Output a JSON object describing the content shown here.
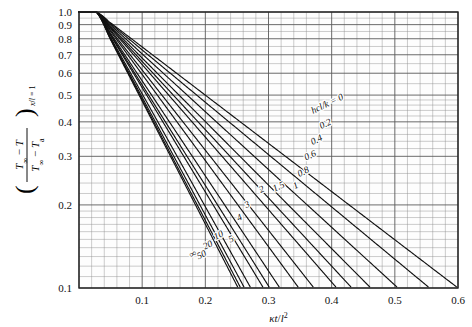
{
  "chart_data": {
    "type": "line",
    "title": "",
    "xlabel": "κt/l²",
    "ylabel": "(T∞ − T)/(T∞ − Ta) at x/l = 1",
    "ylabel_parts": {
      "numerator": "T∞ − T",
      "denominator": "T∞ − Ta",
      "subscript": "x/l = 1"
    },
    "xlim": [
      0,
      0.6
    ],
    "ylim": [
      0.1,
      1.0
    ],
    "yscale": "log",
    "xscale": "linear",
    "grid": true,
    "legend_position": "inline-curve-labels",
    "xticks": [
      0,
      0.1,
      0.2,
      0.3,
      0.4,
      0.5,
      0.6
    ],
    "xticklabels": [
      "",
      "0.1",
      "0.2",
      "0.3",
      "0.4",
      "0.5",
      "0.6"
    ],
    "yticks": [
      0.1,
      0.2,
      0.3,
      0.4,
      0.5,
      0.6,
      0.7,
      0.8,
      0.9,
      1.0
    ],
    "yticklabels": [
      "0.1",
      "0.2",
      "0.3",
      "0.4",
      "0.5",
      "0.6",
      "0.7",
      "0.8",
      "0.9",
      "1.0"
    ],
    "x_minor_step": 0.02,
    "parameter_name": "hcl/k",
    "series": [
      {
        "name": "0",
        "label": "hcl/k = 0",
        "label_x": 0.395,
        "label_y": 0.455
      },
      {
        "name": "0.2",
        "label": "0.2",
        "label_x": 0.392,
        "label_y": 0.385
      },
      {
        "name": "0.4",
        "label": "0.4",
        "label_x": 0.378,
        "label_y": 0.337
      },
      {
        "name": "0.6",
        "label": "0.6",
        "label_x": 0.368,
        "label_y": 0.296
      },
      {
        "name": "0.8",
        "label": "0.8",
        "label_x": 0.357,
        "label_y": 0.258
      },
      {
        "name": "1",
        "label": "1",
        "label_x": 0.345,
        "label_y": 0.23
      },
      {
        "name": "1.5",
        "label": "1.5",
        "label_x": 0.318,
        "label_y": 0.228
      },
      {
        "name": "2",
        "label": "2",
        "label_x": 0.291,
        "label_y": 0.223
      },
      {
        "name": "3",
        "label": "3",
        "label_x": 0.268,
        "label_y": 0.196
      },
      {
        "name": "4",
        "label": "4",
        "label_x": 0.256,
        "label_y": 0.176
      },
      {
        "name": "5",
        "label": "5",
        "label_x": 0.243,
        "label_y": 0.147
      },
      {
        "name": "10",
        "label": "10",
        "label_x": 0.223,
        "label_y": 0.152
      },
      {
        "name": "20",
        "label": "20",
        "label_x": 0.206,
        "label_y": 0.14
      },
      {
        "name": "50",
        "label": "50",
        "label_x": 0.196,
        "label_y": 0.129
      },
      {
        "name": "∞",
        "label": "∞",
        "label_x": 0.182,
        "label_y": 0.13
      }
    ],
    "curve_exit_points": {
      "description": "Approximate x where each curve crosses y = 0.1",
      "values": {
        "0": 0.6,
        "0.2": 0.555,
        "0.4": 0.505,
        "0.6": 0.462,
        "0.8": 0.432,
        "1": 0.408,
        "1.5": 0.372,
        "2": 0.348,
        "3": 0.318,
        "4": 0.302,
        "5": 0.292,
        "10": 0.272,
        "20": 0.262,
        "50": 0.256,
        "∞": 0.252
      }
    },
    "curve_shape_params": {
      "description": "Each curve starts near (0,1.0), bends over a short transient, then decays exponentially; slope magnitude grows with hcl/k.",
      "knee_x": 0.05,
      "start_value": 1.0
    }
  }
}
